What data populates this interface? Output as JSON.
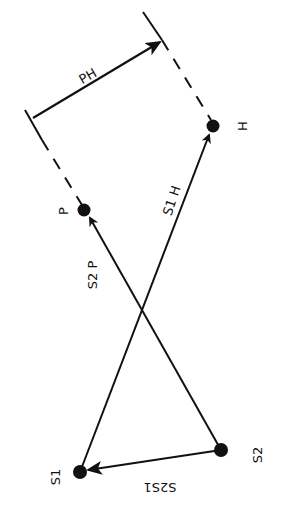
{
  "diagram": {
    "nodes": {
      "S1": {
        "label": "S1",
        "x": 80,
        "y": 472
      },
      "S2": {
        "label": "S2",
        "x": 221,
        "y": 450
      },
      "P": {
        "label": "P",
        "x": 84,
        "y": 210
      },
      "H": {
        "label": "H",
        "x": 213,
        "y": 126
      }
    },
    "edges": {
      "S2S1": {
        "label": "S2S1",
        "from": "S2",
        "to": "S1",
        "style": "solid-arrow"
      },
      "S2P": {
        "label": "S2 P",
        "from": "S2",
        "to": "P",
        "style": "solid-arrow"
      },
      "S1H": {
        "label": "S1 H",
        "from": "S1",
        "to": "H",
        "style": "solid-arrow"
      },
      "PH": {
        "label": "PH",
        "style": "dimension-arrow"
      }
    },
    "colors": {
      "ink": "#111111",
      "background": "#ffffff"
    }
  }
}
